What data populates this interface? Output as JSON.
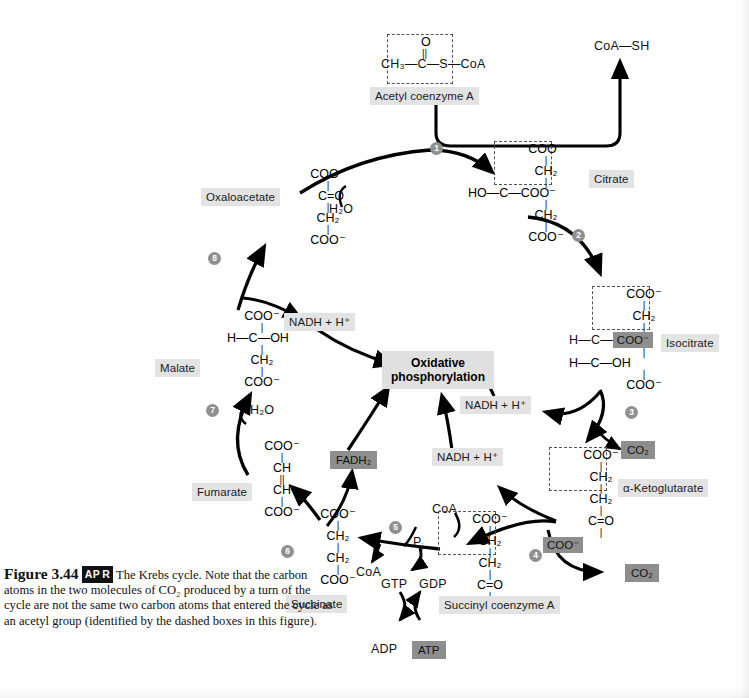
{
  "figure": {
    "number": "Figure 3.44",
    "badge": "AP R",
    "badge_parts": [
      "AP",
      "R"
    ],
    "caption": "The Krebs cycle. Note that the carbon atoms in the two molecules of CO2 produced by a turn of the cycle are not the same two carbon atoms that entered the cycle as an acetyl group (identified by the dashed boxes in this figure).",
    "caption_lines": [
      "The Krebs cycle. Note",
      "that the carbon atoms in the two molecules of CO₂",
      "produced by a turn of the cycle are not the same",
      "two carbon atoms that entered the cycle as an acetyl",
      "group (identified by the dashed boxes in this figure)."
    ]
  },
  "colors": {
    "label_bg": "#e3e3e3",
    "dark_label_bg": "#8e8e8e",
    "step_circle_bg": "#909090",
    "arrow": "#000000",
    "dashed_box": "#555555"
  },
  "center": {
    "oxidative_phosphorylation_line1": "Oxidative",
    "oxidative_phosphorylation_line2": "phosphorylation"
  },
  "molecules": {
    "acetyl_coa": {
      "name": "Acetyl coenzyme A",
      "lines": [
        "O",
        "||",
        "CH₃—C—S—CoA"
      ],
      "top_atom": "O",
      "formula_left": "CH",
      "formula_left_sub": "3",
      "chain": "—C—",
      "tail": "S—CoA"
    },
    "citrate": {
      "name": "Citrate",
      "rows": [
        "COO⁻",
        "CH₂",
        "HO—C—COO⁻",
        "CH₂",
        "COO⁻"
      ]
    },
    "isocitrate": {
      "name": "Isocitrate",
      "rows": [
        "COO⁻",
        "CH₂",
        "H—C—",
        "COO⁻",
        "H—C—OH",
        "COO⁻"
      ],
      "highlighted": "COO⁻"
    },
    "alpha_ketoglutarate": {
      "name": "α-Ketoglutarate",
      "rows": [
        "COO⁻",
        "CH₂",
        "CH₂",
        "C=O",
        "COO⁻"
      ],
      "highlighted": "COO⁻"
    },
    "succinyl_coa": {
      "name": "Succinyl coenzyme A",
      "rows": [
        "COO⁻",
        "CH₂",
        "CH₂",
        "C=O",
        "S—CoA"
      ]
    },
    "succinate": {
      "name": "Succinate",
      "rows": [
        "COO⁻",
        "CH₂",
        "CH₂",
        "COO⁻"
      ]
    },
    "fumarate": {
      "name": "Fumarate",
      "rows": [
        "COO⁻",
        "CH",
        "||",
        "CH",
        "COO⁻"
      ]
    },
    "malate": {
      "name": "Malate",
      "rows": [
        "COO⁻",
        "H—C—OH",
        "CH₂",
        "COO⁻"
      ]
    },
    "oxaloacetate": {
      "name": "Oxaloacetate",
      "rows": [
        "COO⁻",
        "C=O",
        "CH₂",
        "COO⁻"
      ]
    }
  },
  "reagents": {
    "coa_sh": "CoA—SH",
    "water_top": "H₂O",
    "water_step7": "H₂O",
    "coa_step4": "CoA",
    "coa_step5": "CoA",
    "pi": "P",
    "pi_sub": "i",
    "gtp": "GTP",
    "gdp": "GDP",
    "adp": "ADP",
    "atp": "ATP",
    "co2_step3": "CO₂",
    "co2_step4": "CO₂",
    "fadh2": "FADH₂",
    "nadh_step3": "NADH + H⁺",
    "nadh_step4": "NADH + H⁺",
    "nadh_step8": "NADH + H⁺"
  },
  "steps": [
    {
      "id": "1",
      "label": "1"
    },
    {
      "id": "2",
      "label": "2"
    },
    {
      "id": "3",
      "label": "3"
    },
    {
      "id": "4",
      "label": "4"
    },
    {
      "id": "5",
      "label": "5"
    },
    {
      "id": "6",
      "label": "6"
    },
    {
      "id": "7",
      "label": "7"
    },
    {
      "id": "8",
      "label": "8"
    }
  ]
}
